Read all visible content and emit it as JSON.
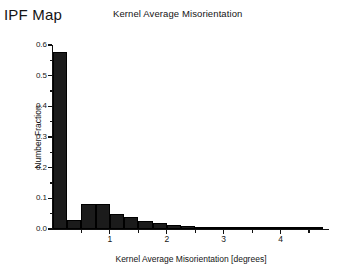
{
  "panel": {
    "ipf_map_label": "IPF Map"
  },
  "chart_data": {
    "type": "bar",
    "title": "Kernel Average Misorientation",
    "xlabel": "Kernel Average Misorientation [degrees]",
    "ylabel": "Number Fraction",
    "xlim": [
      0,
      4.85
    ],
    "ylim": [
      0,
      0.6
    ],
    "grid": false,
    "legend": null,
    "bin_width": 0.25,
    "xticks": [
      1,
      2,
      3,
      4
    ],
    "xtick_labels": [
      "1",
      "2",
      "3",
      "4"
    ],
    "xminor_ticks": [
      0.5,
      1.5,
      2.5,
      3.5,
      4.5
    ],
    "yticks": [
      0.0,
      0.1,
      0.2,
      0.3,
      0.4,
      0.5,
      0.6
    ],
    "ytick_labels": [
      "0.0",
      "0.1",
      "0.2",
      "0.3",
      "0.4",
      "0.5",
      "0.6"
    ],
    "yminor_ticks": [
      0.05,
      0.15,
      0.25,
      0.35,
      0.45,
      0.55
    ],
    "bin_edges": [
      0.0,
      0.25,
      0.5,
      0.75,
      1.0,
      1.25,
      1.5,
      1.75,
      2.0,
      2.25,
      2.5,
      2.75,
      3.0,
      3.25,
      3.5,
      3.75,
      4.0,
      4.25,
      4.5,
      4.75
    ],
    "categories": [
      "0.00-0.25",
      "0.25-0.50",
      "0.50-0.75",
      "0.75-1.00",
      "1.00-1.25",
      "1.25-1.50",
      "1.50-1.75",
      "1.75-2.00",
      "2.00-2.25",
      "2.25-2.50",
      "2.50-2.75",
      "2.75-3.00",
      "3.00-3.25",
      "3.25-3.50",
      "3.50-3.75",
      "3.75-4.00",
      "4.00-4.25",
      "4.25-4.50",
      "4.50-4.75"
    ],
    "values": [
      0.578,
      0.03,
      0.081,
      0.081,
      0.05,
      0.038,
      0.026,
      0.019,
      0.013,
      0.009,
      0.006,
      0.005,
      0.004,
      0.003,
      0.002,
      0.002,
      0.001,
      0.001,
      0.001
    ],
    "bar_color": "#1b1b1b"
  }
}
